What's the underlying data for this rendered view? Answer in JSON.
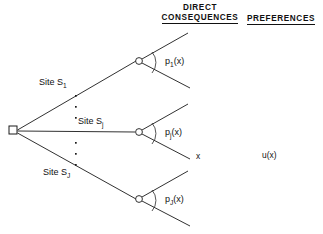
{
  "figure": {
    "background_color": "#ffffff",
    "line_color": "#1a1a1a"
  },
  "headers": {
    "direct_consequences_line1": "DIRECT",
    "direct_consequences_line2": "CONSEQUENCES",
    "preferences": "PREFERENCES"
  },
  "branches": [
    {
      "site_label_prefix": "Site S",
      "site_label_sub": "1",
      "prob_prefix": "p",
      "prob_sub": "1",
      "prob_suffix": "(x)"
    },
    {
      "site_label_prefix": "Site S",
      "site_label_sub": "j",
      "prob_prefix": "p",
      "prob_sub": "j",
      "prob_suffix": "(x)"
    },
    {
      "site_label_prefix": "Site S",
      "site_label_sub": "J",
      "prob_prefix": "p",
      "prob_sub": "J",
      "prob_suffix": "(x)"
    }
  ],
  "labels": {
    "site_1": "Site S",
    "site_1_sub": "1",
    "site_j": "Site S",
    "site_j_sub": "j",
    "site_J": "Site S",
    "site_J_sub": "J",
    "p_1": "p",
    "p_1_sub": "1",
    "p_1_arg": "(x)",
    "p_j": "p",
    "p_j_sub": "j",
    "p_j_arg": "(x)",
    "p_J": "p",
    "p_J_sub": "J",
    "p_J_arg": "(x)",
    "outcome_x": "x",
    "utility_u": "u(x)"
  },
  "nodes": {
    "decision_node_shape": "square",
    "chance_node_shape": "circle",
    "chance_node_count": 3
  },
  "vertical_ellipsis": {
    "upper_dots": 3,
    "lower_dots": 3
  }
}
